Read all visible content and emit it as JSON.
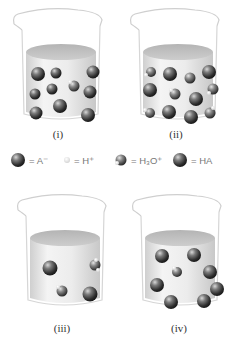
{
  "figure": {
    "beakers": [
      {
        "id": "i",
        "label": "(i)",
        "contents": {
          "A_minus": 2,
          "H3O_plus": 1,
          "HA": 8
        }
      },
      {
        "id": "ii",
        "label": "(ii)",
        "contents": {
          "A_minus": 5,
          "H3O_plus": 5,
          "HA": 4
        }
      },
      {
        "id": "iii",
        "label": "(iii)",
        "contents": {
          "A_minus": 1,
          "H3O_plus": 2,
          "HA": 1
        }
      },
      {
        "id": "iv",
        "label": "(iv)",
        "contents": {
          "A_minus": 0,
          "H3O_plus": 1,
          "HA": 7
        }
      }
    ],
    "legend": [
      {
        "symbol": "A-",
        "text": "= A⁻",
        "icon": "anion-sphere-icon"
      },
      {
        "symbol": "H+",
        "text": "= H⁺",
        "icon": "proton-sphere-icon"
      },
      {
        "symbol": "H3O+",
        "text": "= H₃O⁺",
        "icon": "hydronium-sphere-icon"
      },
      {
        "symbol": "HA",
        "text": "= HA",
        "icon": "acid-molecule-sphere-icon"
      }
    ]
  }
}
